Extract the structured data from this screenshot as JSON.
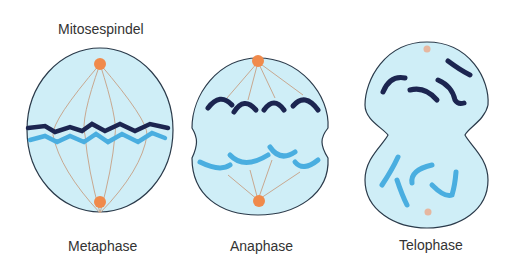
{
  "title_label": "Mitosespindel",
  "phases": [
    {
      "label": "Metaphase"
    },
    {
      "label": "Anaphase"
    },
    {
      "label": "Telophase"
    }
  ],
  "colors": {
    "cell_fill": "#cfeef7",
    "cell_outline": "#2a3a4a",
    "spindle": "#c8a890",
    "centrosome": "#f08a4b",
    "chromosome_dark": "#1c2550",
    "chromosome_light": "#4aaee0"
  }
}
